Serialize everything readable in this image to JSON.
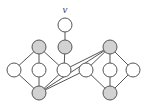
{
  "figure": {
    "background_color": "#ffffff",
    "colors": {
      "edge": "#555555",
      "node_outline": "#555555",
      "node_fill_white": "#ffffff",
      "node_fill_shaded": "#d2d2d2",
      "label": "#4a4a4a"
    },
    "node_radius": 7
  },
  "labels": [
    {
      "id": "label-v",
      "text": "v",
      "x": 65,
      "y": 13,
      "style": "italic"
    }
  ],
  "nodes": [
    {
      "id": "v",
      "name": "vertex-v",
      "x": 65,
      "y": 25,
      "fill": "white"
    },
    {
      "id": "m1",
      "name": "vertex-mid-upper",
      "x": 65,
      "y": 47,
      "fill": "shaded"
    },
    {
      "id": "lt",
      "name": "vertex-left-top",
      "x": 39,
      "y": 47,
      "fill": "shaded"
    },
    {
      "id": "ll",
      "name": "vertex-left-left",
      "x": 14,
      "y": 70,
      "fill": "white"
    },
    {
      "id": "lc",
      "name": "vertex-left-center",
      "x": 39,
      "y": 70,
      "fill": "white"
    },
    {
      "id": "lr",
      "name": "vertex-left-right",
      "x": 64,
      "y": 70,
      "fill": "white"
    },
    {
      "id": "lb",
      "name": "vertex-left-bottom",
      "x": 39,
      "y": 93,
      "fill": "shaded"
    },
    {
      "id": "rt",
      "name": "vertex-right-top",
      "x": 110,
      "y": 47,
      "fill": "shaded"
    },
    {
      "id": "rl",
      "name": "vertex-right-left",
      "x": 86,
      "y": 70,
      "fill": "white"
    },
    {
      "id": "rc",
      "name": "vertex-right-center",
      "x": 110,
      "y": 70,
      "fill": "white"
    },
    {
      "id": "rr",
      "name": "vertex-right-right",
      "x": 133,
      "y": 70,
      "fill": "white"
    },
    {
      "id": "rb",
      "name": "vertex-right-bottom",
      "x": 110,
      "y": 93,
      "fill": "shaded"
    }
  ],
  "edges": [
    {
      "id": "e1",
      "name": "edge-v-m1",
      "from": "v",
      "to": "m1"
    },
    {
      "id": "e2",
      "name": "edge-m1-lr",
      "from": "m1",
      "to": "lr"
    },
    {
      "id": "e3",
      "name": "edge-lt-ll",
      "from": "lt",
      "to": "ll"
    },
    {
      "id": "e4",
      "name": "edge-lt-lc",
      "from": "lt",
      "to": "lc"
    },
    {
      "id": "e5",
      "name": "edge-lt-lr",
      "from": "lt",
      "to": "lr"
    },
    {
      "id": "e6",
      "name": "edge-ll-lb",
      "from": "ll",
      "to": "lb"
    },
    {
      "id": "e7",
      "name": "edge-lc-lb",
      "from": "lc",
      "to": "lb"
    },
    {
      "id": "e8",
      "name": "edge-lr-lb",
      "from": "lr",
      "to": "lb"
    },
    {
      "id": "e9",
      "name": "edge-lr-rt",
      "from": "lr",
      "to": "rt"
    },
    {
      "id": "e10",
      "name": "edge-lb-rt",
      "from": "lb",
      "to": "rt"
    },
    {
      "id": "e11",
      "name": "edge-lb-rl",
      "from": "lb",
      "to": "rl"
    },
    {
      "id": "e12",
      "name": "edge-rt-rl",
      "from": "rt",
      "to": "rl"
    },
    {
      "id": "e13",
      "name": "edge-rt-rc",
      "from": "rt",
      "to": "rc"
    },
    {
      "id": "e14",
      "name": "edge-rt-rr",
      "from": "rt",
      "to": "rr"
    },
    {
      "id": "e15",
      "name": "edge-rl-rb",
      "from": "rl",
      "to": "rb"
    },
    {
      "id": "e16",
      "name": "edge-rc-rb",
      "from": "rc",
      "to": "rb"
    },
    {
      "id": "e17",
      "name": "edge-rr-rb",
      "from": "rr",
      "to": "rb"
    }
  ]
}
